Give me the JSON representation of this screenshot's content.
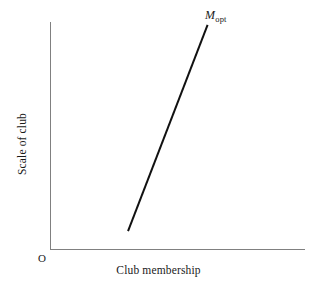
{
  "figure": {
    "background_color": "#ffffff",
    "width": 317,
    "height": 288
  },
  "axes": {
    "origin_label": "O",
    "x_axis_label": "Club membership",
    "y_axis_label": "Scale of club",
    "axis_color": "#808080",
    "axis_line_width": 1
  },
  "annotations": {
    "curve_endpoint_label_base": "M",
    "curve_endpoint_label_subscript": "opt",
    "curve_endpoint_label_full": "Mopt"
  },
  "chart_data": {
    "type": "line",
    "title": "",
    "subtitle": "",
    "xlabel": "Club membership",
    "ylabel": "Scale of club",
    "origin_marker": "O",
    "grid": false,
    "legend": false,
    "legend_position": "none",
    "axis_ticks": [],
    "xlim": [
      0,
      1
    ],
    "ylim": [
      0,
      1
    ],
    "series": [
      {
        "name": "Mopt",
        "label": "Mopt",
        "color": "#111111",
        "line_width": 2,
        "style": "solid",
        "comment": "Single straight upward-sloping segment; values are normalized fractions of the plotted axis box.",
        "x": [
          0.306,
          0.618
        ],
        "y": [
          0.079,
          0.987
        ]
      }
    ],
    "annotations": [
      {
        "text": "Mopt",
        "base": "M",
        "subscript": "opt",
        "x": 0.618,
        "y": 0.987,
        "position": "above-right-of-line-endpoint",
        "italic": true
      }
    ]
  }
}
